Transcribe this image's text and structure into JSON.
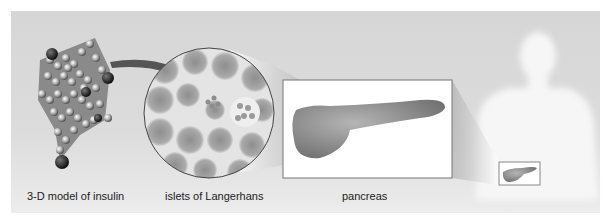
{
  "figure": {
    "type": "scale-progression-illustration",
    "labels": {
      "insulin": "3-D model of insulin",
      "islets": "islets of Langerhans",
      "pancreas": "pancreas"
    },
    "colors": {
      "panel_bg": "#d9d9d9",
      "arrow": "#555555",
      "box_border": "#777777",
      "body_silhouette": "#f4f4f4",
      "tissue": "#9a9a9a"
    }
  }
}
